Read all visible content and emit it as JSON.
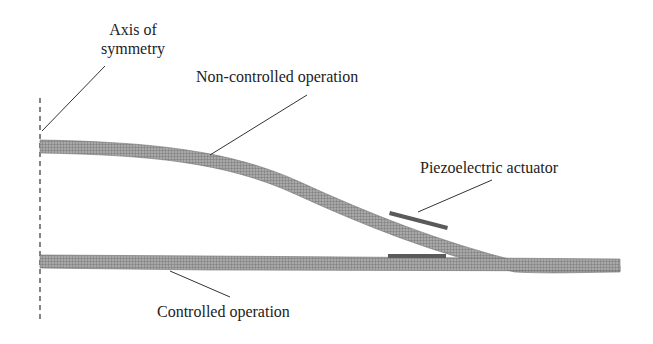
{
  "diagram": {
    "type": "finite-element plate deflection comparison",
    "labels": {
      "axis_line1": "Axis of",
      "axis_line2": "symmetry",
      "non_controlled": "Non-controlled operation",
      "piezo": "Piezoelectric actuator",
      "controlled": "Controlled operation"
    },
    "colors": {
      "mesh": "#8a8a8a",
      "mesh_dark": "#5a5a5a",
      "actuator": "#555555",
      "leader": "#333333",
      "axis": "#333333",
      "text": "#222222"
    }
  }
}
